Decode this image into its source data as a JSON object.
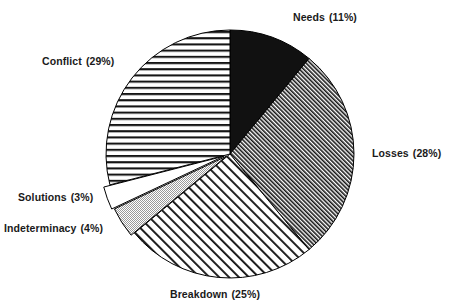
{
  "chart_data": {
    "type": "pie",
    "title": "",
    "subtitle": "",
    "xlabel": "",
    "ylabel": "",
    "grid": false,
    "legend_position": "outside-labels",
    "start_angle_deg": 0,
    "direction": "clockwise",
    "units": "percent",
    "total": 100,
    "categories": [
      "Needs",
      "Losses",
      "Breakdown",
      "Indeterminacy",
      "Solutions",
      "Conflict"
    ],
    "values": [
      11,
      28,
      25,
      4,
      3,
      29
    ],
    "annotations": [],
    "slices": [
      {
        "name": "Needs",
        "value": 11,
        "percent_text": "(11%)",
        "label_text": "Needs  (11%)",
        "fill_pattern": "solid-black",
        "fill_color": "#111111",
        "start_deg": 0,
        "end_deg": 39.6
      },
      {
        "name": "Losses",
        "value": 28,
        "percent_text": "(28%)",
        "label_text": "Losses  (28%)",
        "fill_pattern": "dense-diagonal-hatch",
        "fill_color": "#8a8a8a",
        "start_deg": 39.6,
        "end_deg": 140.4
      },
      {
        "name": "Breakdown",
        "value": 25,
        "percent_text": "(25%)",
        "label_text": "Breakdown  (25%)",
        "fill_pattern": "wide-diagonal-hatch",
        "fill_color": "#ffffff",
        "start_deg": 140.4,
        "end_deg": 230.4
      },
      {
        "name": "Indeterminacy",
        "value": 4,
        "percent_text": "(4%)",
        "label_text": "Indeterminacy  (4%)",
        "fill_pattern": "light-gray-stipple",
        "fill_color": "#c9c9c9",
        "start_deg": 230.4,
        "end_deg": 244.8
      },
      {
        "name": "Solutions",
        "value": 3,
        "percent_text": "(3%)",
        "label_text": "Solutions  (3%)",
        "fill_pattern": "blank-white",
        "fill_color": "#ffffff",
        "start_deg": 244.8,
        "end_deg": 255.6
      },
      {
        "name": "Conflict",
        "value": 29,
        "percent_text": "(29%)",
        "label_text": "Conflict  (29%)",
        "fill_pattern": "horizontal-lines",
        "fill_color": "#ffffff",
        "start_deg": 255.6,
        "end_deg": 360
      }
    ]
  },
  "labels": {
    "needs": {
      "name": "Needs",
      "pct": "(11%)"
    },
    "conflict": {
      "name": "Conflict",
      "pct": "(29%)"
    },
    "losses": {
      "name": "Losses",
      "pct": "(28%)"
    },
    "solutions": {
      "name": "Solutions",
      "pct": "(3%)"
    },
    "indeterminacy": {
      "name": "Indeterminacy",
      "pct": "(4%)"
    },
    "breakdown": {
      "name": "Breakdown",
      "pct": "(25%)"
    }
  },
  "colors": {
    "background": "#ffffff",
    "stroke": "#000000",
    "text": "#1a1a1a",
    "needs_fill": "#111111",
    "indeterminacy_fill": "#c9c9c9"
  }
}
